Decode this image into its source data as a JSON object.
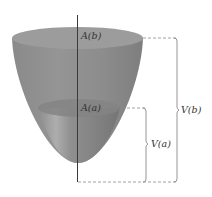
{
  "figure": {
    "type": "paraboloid-volume-diagram",
    "labels": {
      "area_top": "A(b)",
      "area_mid": "A(a)",
      "volume_mid": "V(a)",
      "volume_top": "V(b)"
    },
    "colors": {
      "surface": "#8e8e8e",
      "surface_dark": "#7a7a7a",
      "surface_light": "#a8a8a8",
      "rim": "#9a9a9a",
      "cross_section": "#858585",
      "axis": "#3a3a3a",
      "dashed": "#8a8a8a",
      "bracket": "#8a8a8a",
      "text": "#333333"
    }
  }
}
